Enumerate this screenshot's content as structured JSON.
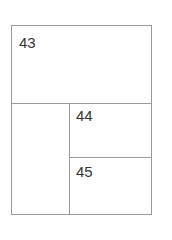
{
  "diagram": {
    "type": "page-layout",
    "line_color": "#9a9a9a",
    "text_color": "#333333",
    "panels": [
      {
        "id": "top",
        "label": "43"
      },
      {
        "id": "bottom-left",
        "label": ""
      },
      {
        "id": "bottom-right-top",
        "label": "44"
      },
      {
        "id": "bottom-right-bottom",
        "label": "45"
      }
    ]
  }
}
